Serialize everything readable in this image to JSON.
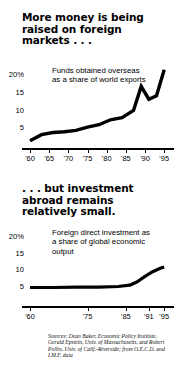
{
  "headlines": {
    "first": "More money is being raised on foreign markets . . .",
    "second": ". . . but investment abroad remains relatively small."
  },
  "source": {
    "text": "Sources: Dean Baker, Economic Policy Institute, Gerald Epstein, Univ. of Massachusetts, and Robert Pollin, Univ. of Calif.-Riverside; from O.E.C.D. and I.M.F. data"
  },
  "chart_data": [
    {
      "type": "line",
      "title": "More money is being raised on foreign markets . . .",
      "annotation": "Funds obtained overseas as a share of world exports",
      "xlabel": "",
      "ylabel": "",
      "ylim": [
        0,
        22
      ],
      "yticks": [
        20,
        15,
        10,
        5
      ],
      "ytick_labels": [
        "20%",
        "15",
        "10",
        "5"
      ],
      "xlim": [
        1960,
        1996
      ],
      "xticks": [
        1960,
        1965,
        1970,
        1975,
        1980,
        1985,
        1990,
        1995
      ],
      "xtick_labels": [
        "'60",
        "'65",
        "'70",
        "'75",
        "'80",
        "'85",
        "'90",
        "'95"
      ],
      "grid": false,
      "legend": "none",
      "x": [
        1960,
        1963,
        1966,
        1969,
        1972,
        1975,
        1978,
        1981,
        1984,
        1987,
        1989,
        1991,
        1993,
        1995
      ],
      "values": [
        1.5,
        3.2,
        3.8,
        4.0,
        4.4,
        5.3,
        6.0,
        7.4,
        8.0,
        10.0,
        16.8,
        13.2,
        14.2,
        21.5
      ]
    },
    {
      "type": "line",
      "title": ". . . but investment abroad remains relatively small.",
      "annotation": "Foreign direct investment as a share of global economic output",
      "xlabel": "",
      "ylabel": "",
      "ylim": [
        0,
        22
      ],
      "yticks": [
        20,
        15,
        10,
        5
      ],
      "ytick_labels": [
        "20%",
        "15",
        "10",
        "5"
      ],
      "xlim": [
        1960,
        1996
      ],
      "xticks": [
        1960,
        1975,
        1985,
        1991,
        1995
      ],
      "xtick_labels": [
        "'60",
        "'75",
        "'85",
        "'91",
        "'95"
      ],
      "grid": false,
      "legend": "none",
      "x": [
        1960,
        1966,
        1972,
        1978,
        1983,
        1986,
        1988,
        1990,
        1992,
        1994,
        1995
      ],
      "values": [
        4.9,
        4.9,
        5.0,
        5.0,
        5.2,
        5.6,
        6.6,
        8.2,
        9.6,
        10.6,
        11.0
      ]
    }
  ]
}
